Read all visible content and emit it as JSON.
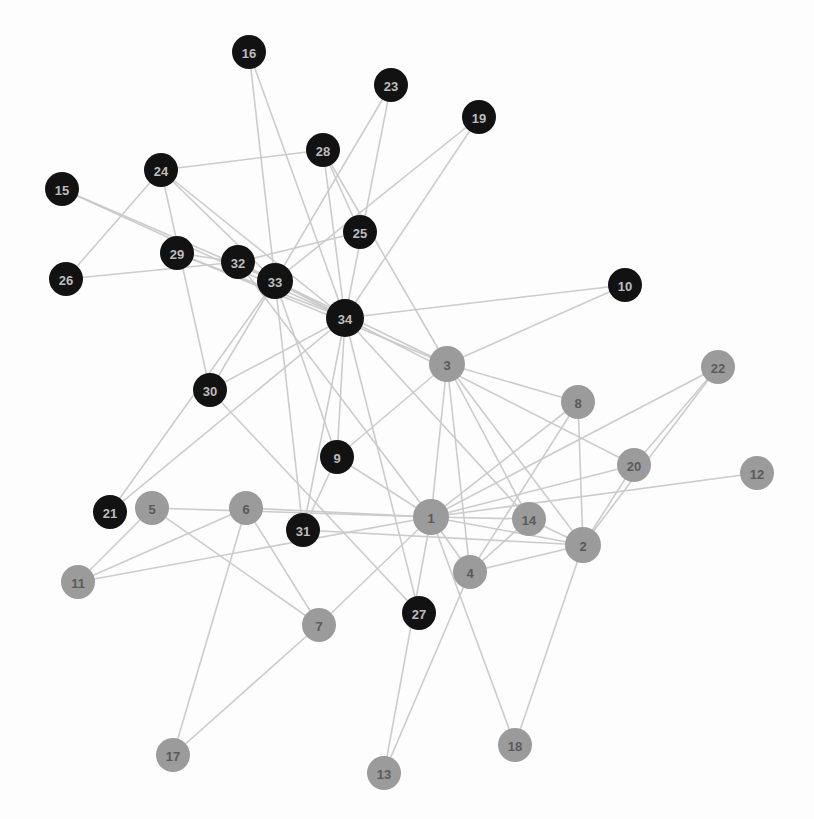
{
  "figure": {
    "kind": "network-graph",
    "title": "",
    "background_color": "#ffffff",
    "width": 814,
    "height": 819
  },
  "style": {
    "edge_color": "#c9c9c9",
    "edge_width": 1.6,
    "group_a_color": "#121212",
    "group_a_label_color": "#bdbdbd",
    "group_b_color": "#9b9b9b",
    "group_b_label_color": "#5a5a5a",
    "node_radius": 17
  },
  "chart_data": {
    "type": "scatter",
    "title": "",
    "xlabel": "",
    "ylabel": "",
    "grid": false,
    "legend": "none",
    "graph_kind": "node-link-network",
    "node_count": 34,
    "edge_count": 78,
    "groups": [
      {
        "id": "A",
        "color": "#121212",
        "label_color": "#bdbdbd",
        "members": [
          9,
          10,
          15,
          16,
          19,
          21,
          23,
          24,
          25,
          26,
          27,
          28,
          29,
          30,
          31,
          32,
          33,
          34
        ]
      },
      {
        "id": "B",
        "color": "#9b9b9b",
        "label_color": "#5a5a5a",
        "members": [
          1,
          2,
          3,
          4,
          5,
          6,
          7,
          8,
          11,
          12,
          13,
          14,
          17,
          18,
          20,
          22
        ]
      }
    ],
    "nodes": [
      {
        "id": 1,
        "label": "1",
        "x": 431,
        "y": 517,
        "group": "B",
        "r": 18
      },
      {
        "id": 2,
        "label": "2",
        "x": 583,
        "y": 545,
        "group": "B",
        "r": 18
      },
      {
        "id": 3,
        "label": "3",
        "x": 447,
        "y": 364,
        "group": "B",
        "r": 18
      },
      {
        "id": 4,
        "label": "4",
        "x": 470,
        "y": 572,
        "group": "B",
        "r": 17
      },
      {
        "id": 5,
        "label": "5",
        "x": 152,
        "y": 508,
        "group": "B",
        "r": 17
      },
      {
        "id": 6,
        "label": "6",
        "x": 246,
        "y": 508,
        "group": "B",
        "r": 17
      },
      {
        "id": 7,
        "label": "7",
        "x": 319,
        "y": 625,
        "group": "B",
        "r": 17
      },
      {
        "id": 8,
        "label": "8",
        "x": 578,
        "y": 402,
        "group": "B",
        "r": 17
      },
      {
        "id": 9,
        "label": "9",
        "x": 337,
        "y": 457,
        "group": "A",
        "r": 17
      },
      {
        "id": 10,
        "label": "10",
        "x": 625,
        "y": 285,
        "group": "A",
        "r": 17
      },
      {
        "id": 11,
        "label": "11",
        "x": 78,
        "y": 582,
        "group": "B",
        "r": 17
      },
      {
        "id": 12,
        "label": "12",
        "x": 757,
        "y": 473,
        "group": "B",
        "r": 17
      },
      {
        "id": 13,
        "label": "13",
        "x": 384,
        "y": 773,
        "group": "B",
        "r": 17
      },
      {
        "id": 14,
        "label": "14",
        "x": 529,
        "y": 519,
        "group": "B",
        "r": 17
      },
      {
        "id": 15,
        "label": "15",
        "x": 62,
        "y": 189,
        "group": "A",
        "r": 17
      },
      {
        "id": 16,
        "label": "16",
        "x": 249,
        "y": 52,
        "group": "A",
        "r": 17
      },
      {
        "id": 17,
        "label": "17",
        "x": 173,
        "y": 755,
        "group": "B",
        "r": 17
      },
      {
        "id": 18,
        "label": "18",
        "x": 515,
        "y": 745,
        "group": "B",
        "r": 17
      },
      {
        "id": 19,
        "label": "19",
        "x": 479,
        "y": 117,
        "group": "A",
        "r": 17
      },
      {
        "id": 20,
        "label": "20",
        "x": 634,
        "y": 465,
        "group": "B",
        "r": 17
      },
      {
        "id": 21,
        "label": "21",
        "x": 110,
        "y": 512,
        "group": "A",
        "r": 17
      },
      {
        "id": 22,
        "label": "22",
        "x": 718,
        "y": 367,
        "group": "B",
        "r": 17
      },
      {
        "id": 23,
        "label": "23",
        "x": 391,
        "y": 85,
        "group": "A",
        "r": 17
      },
      {
        "id": 24,
        "label": "24",
        "x": 161,
        "y": 170,
        "group": "A",
        "r": 17
      },
      {
        "id": 25,
        "label": "25",
        "x": 360,
        "y": 232,
        "group": "A",
        "r": 17
      },
      {
        "id": 26,
        "label": "26",
        "x": 66,
        "y": 279,
        "group": "A",
        "r": 17
      },
      {
        "id": 27,
        "label": "27",
        "x": 419,
        "y": 613,
        "group": "A",
        "r": 17
      },
      {
        "id": 28,
        "label": "28",
        "x": 323,
        "y": 150,
        "group": "A",
        "r": 17
      },
      {
        "id": 29,
        "label": "29",
        "x": 177,
        "y": 253,
        "group": "A",
        "r": 17
      },
      {
        "id": 30,
        "label": "30",
        "x": 210,
        "y": 390,
        "group": "A",
        "r": 17
      },
      {
        "id": 31,
        "label": "31",
        "x": 303,
        "y": 530,
        "group": "A",
        "r": 17
      },
      {
        "id": 32,
        "label": "32",
        "x": 238,
        "y": 262,
        "group": "A",
        "r": 17
      },
      {
        "id": 33,
        "label": "33",
        "x": 275,
        "y": 281,
        "group": "A",
        "r": 18
      },
      {
        "id": 34,
        "label": "34",
        "x": 345,
        "y": 318,
        "group": "A",
        "r": 19
      }
    ],
    "edges": [
      [
        2,
        1
      ],
      [
        3,
        1
      ],
      [
        3,
        2
      ],
      [
        4,
        1
      ],
      [
        4,
        2
      ],
      [
        4,
        3
      ],
      [
        5,
        1
      ],
      [
        6,
        1
      ],
      [
        7,
        1
      ],
      [
        7,
        5
      ],
      [
        7,
        6
      ],
      [
        8,
        1
      ],
      [
        8,
        2
      ],
      [
        8,
        3
      ],
      [
        8,
        4
      ],
      [
        9,
        1
      ],
      [
        9,
        3
      ],
      [
        10,
        3
      ],
      [
        11,
        1
      ],
      [
        11,
        5
      ],
      [
        11,
        6
      ],
      [
        12,
        1
      ],
      [
        13,
        1
      ],
      [
        13,
        4
      ],
      [
        14,
        1
      ],
      [
        14,
        2
      ],
      [
        14,
        3
      ],
      [
        14,
        4
      ],
      [
        17,
        6
      ],
      [
        17,
        7
      ],
      [
        18,
        1
      ],
      [
        18,
        2
      ],
      [
        20,
        1
      ],
      [
        20,
        2
      ],
      [
        22,
        1
      ],
      [
        22,
        2
      ],
      [
        26,
        24
      ],
      [
        28,
        3
      ],
      [
        28,
        24
      ],
      [
        28,
        25
      ],
      [
        29,
        3
      ],
      [
        30,
        24
      ],
      [
        30,
        27
      ],
      [
        31,
        2
      ],
      [
        31,
        9
      ],
      [
        32,
        1
      ],
      [
        32,
        25
      ],
      [
        32,
        26
      ],
      [
        32,
        29
      ],
      [
        33,
        3
      ],
      [
        33,
        9
      ],
      [
        33,
        15
      ],
      [
        33,
        16
      ],
      [
        33,
        19
      ],
      [
        33,
        21
      ],
      [
        33,
        23
      ],
      [
        33,
        24
      ],
      [
        33,
        30
      ],
      [
        33,
        31
      ],
      [
        33,
        32
      ],
      [
        34,
        9
      ],
      [
        34,
        10
      ],
      [
        34,
        14
      ],
      [
        34,
        15
      ],
      [
        34,
        16
      ],
      [
        34,
        19
      ],
      [
        34,
        20
      ],
      [
        34,
        21
      ],
      [
        34,
        23
      ],
      [
        34,
        24
      ],
      [
        34,
        27
      ],
      [
        34,
        28
      ],
      [
        34,
        29
      ],
      [
        34,
        30
      ],
      [
        34,
        31
      ],
      [
        34,
        32
      ],
      [
        34,
        33
      ],
      [
        20,
        22
      ]
    ]
  }
}
